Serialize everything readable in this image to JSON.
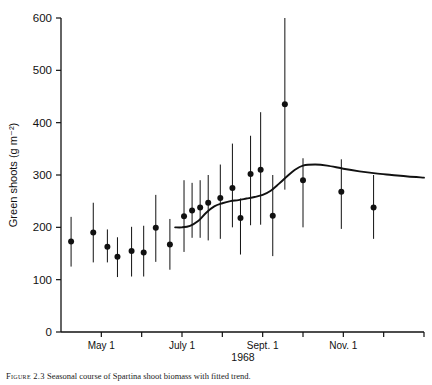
{
  "figure": {
    "caption_prefix": "Figure 2.3",
    "caption_text": "Seasonal course of Spartina shoot biomass with fitted trend."
  },
  "chart_data": {
    "type": "scatter",
    "title": "",
    "subtitle": "",
    "xlabel": "1968",
    "ylabel": "Green shoots (g m⁻²)",
    "ylim": [
      0,
      600
    ],
    "ytick_values": [
      0,
      100,
      200,
      300,
      400,
      500,
      600
    ],
    "ytick_labels": [
      "0",
      "100",
      "200",
      "300",
      "400",
      "500",
      "600"
    ],
    "xlim": [
      0,
      9
    ],
    "xtick_positions": [
      1,
      2,
      3,
      4,
      5,
      6,
      7,
      8,
      9
    ],
    "xtick_labels": [
      "May 1",
      "",
      "July 1",
      "",
      "Sept. 1",
      "",
      "Nov. 1",
      "",
      ""
    ],
    "xtick_labels_all": [
      "May 1",
      "July 1",
      "Sept. 1",
      "Nov. 1"
    ],
    "grid": false,
    "legend": false,
    "legend_position": "none",
    "marker": "filled-circle",
    "error_bar_style": "vertical-line-no-caps",
    "series": [
      {
        "name": "Green shoots",
        "x": [
          0.25,
          0.8,
          1.15,
          1.4,
          1.75,
          2.05,
          2.35,
          2.7,
          3.05,
          3.25,
          3.45,
          3.65,
          3.95,
          4.25,
          4.45,
          4.7,
          4.95,
          5.25,
          5.55,
          6.0,
          6.95,
          7.75
        ],
        "values": [
          173,
          190,
          163,
          144,
          155,
          152,
          199,
          167,
          221,
          232,
          238,
          247,
          256,
          275,
          218,
          302,
          310,
          222,
          435,
          290,
          268,
          238
        ],
        "err_low": [
          125,
          133,
          133,
          105,
          106,
          106,
          134,
          119,
          153,
          180,
          180,
          175,
          178,
          200,
          148,
          204,
          205,
          145,
          272,
          200,
          197,
          178
        ],
        "err_high": [
          220,
          247,
          196,
          181,
          201,
          203,
          262,
          216,
          290,
          285,
          290,
          300,
          320,
          360,
          255,
          375,
          420,
          300,
          600,
          332,
          330,
          300
        ]
      }
    ],
    "fitted_curve": {
      "name": "fitted trend",
      "x": [
        2.83,
        3.0,
        3.2,
        3.4,
        3.6,
        3.8,
        4.0,
        4.2,
        4.4,
        4.6,
        4.8,
        5.0,
        5.2,
        5.4,
        5.6,
        5.8,
        6.0,
        6.3,
        6.6,
        7.0,
        7.4,
        7.8,
        8.2,
        8.6,
        9.0
      ],
      "values": [
        200,
        200,
        203,
        212,
        228,
        240,
        246,
        250,
        252,
        255,
        258,
        262,
        270,
        283,
        297,
        310,
        318,
        320,
        318,
        312,
        307,
        303,
        300,
        297,
        295
      ]
    }
  }
}
